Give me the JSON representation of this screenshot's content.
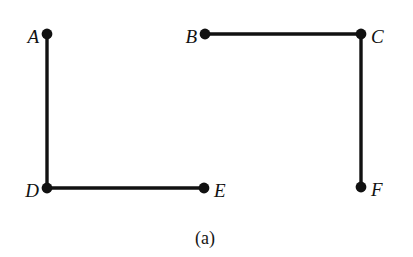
{
  "figure": {
    "caption": "(a)",
    "caption_x": 205,
    "caption_y": 238,
    "width": 413,
    "height": 257,
    "background_color": "#ffffff",
    "ink_color": "#111111",
    "edge_width": 3.4,
    "vertex_radius": 5.4
  },
  "chart_data": {
    "type": "diagram",
    "subtype": "undirected-graph",
    "title": "(a)",
    "xlabel": "",
    "ylabel": "",
    "grid": false,
    "legend": "none",
    "xlim": [
      0,
      413
    ],
    "ylim": [
      257,
      0
    ],
    "nodes": [
      {
        "id": "A",
        "label": "A",
        "x": 47,
        "y": 34,
        "label_side": "left",
        "label_x": 39,
        "label_y": 36
      },
      {
        "id": "B",
        "label": "B",
        "x": 205,
        "y": 34,
        "label_side": "left",
        "label_x": 197,
        "label_y": 36
      },
      {
        "id": "C",
        "label": "C",
        "x": 361,
        "y": 34,
        "label_side": "right",
        "label_x": 371,
        "label_y": 36
      },
      {
        "id": "D",
        "label": "D",
        "x": 47,
        "y": 188,
        "label_side": "left",
        "label_x": 39,
        "label_y": 190
      },
      {
        "id": "E",
        "label": "E",
        "x": 204,
        "y": 188,
        "label_side": "right",
        "label_x": 214,
        "label_y": 190
      },
      {
        "id": "F",
        "label": "F",
        "x": 361,
        "y": 187,
        "label_side": "right",
        "label_x": 371,
        "label_y": 189
      }
    ],
    "edges": [
      {
        "id": "AD",
        "from": "A",
        "to": "D",
        "x1": 47,
        "y1": 34,
        "x2": 47,
        "y2": 188,
        "orientation": "vertical"
      },
      {
        "id": "BC",
        "from": "B",
        "to": "C",
        "x1": 205,
        "y1": 34,
        "x2": 361,
        "y2": 34,
        "orientation": "horizontal"
      },
      {
        "id": "CF",
        "from": "C",
        "to": "F",
        "x1": 361,
        "y1": 34,
        "x2": 361,
        "y2": 187,
        "orientation": "vertical"
      },
      {
        "id": "DE",
        "from": "D",
        "to": "E",
        "x1": 47,
        "y1": 188,
        "x2": 204,
        "y2": 188,
        "orientation": "horizontal"
      }
    ],
    "isolated_nodes": [],
    "node_count": 6,
    "edge_count": 4
  }
}
